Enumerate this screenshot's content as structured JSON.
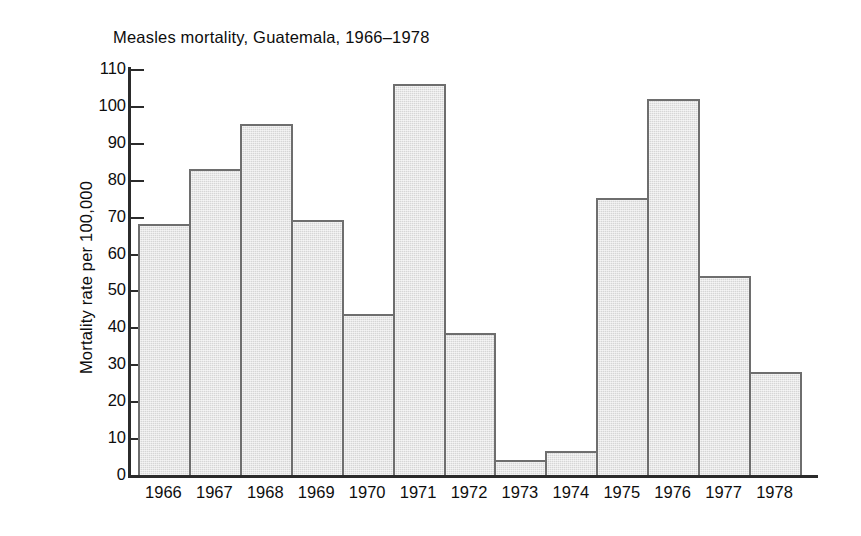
{
  "chart_data": {
    "type": "bar",
    "title": "Measles mortality, Guatemala, 1966–1978",
    "xlabel": "",
    "ylabel": "Mortality rate per 100,000",
    "categories": [
      "1966",
      "1967",
      "1968",
      "1969",
      "1970",
      "1971",
      "1972",
      "1973",
      "1974",
      "1975",
      "1976",
      "1977",
      "1978"
    ],
    "values": [
      68,
      83,
      95,
      69,
      43.5,
      106,
      38.5,
      4,
      6.5,
      75,
      102,
      54,
      28
    ],
    "ylim": [
      0,
      110
    ],
    "ytick_step": 10,
    "yticks": [
      0,
      10,
      20,
      30,
      40,
      50,
      60,
      70,
      80,
      90,
      100,
      110
    ],
    "ytick_labels": [
      "0",
      "10",
      "20",
      "30",
      "40",
      "50",
      "60",
      "70",
      "80",
      "90",
      "100",
      "110"
    ],
    "grid": false,
    "legend": null,
    "bar_fill_color": "#d6d6d6",
    "bar_border_color": "#6e6e6e",
    "axis_color": "#2b2b2b",
    "background_color": "#ffffff"
  }
}
